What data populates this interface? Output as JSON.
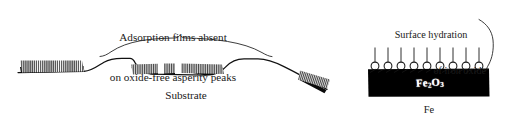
{
  "figure": {
    "domain": "scientific-diagram",
    "background_color": "#ffffff",
    "ink_color": "#1a1a1a",
    "oxide_block_color": "#000000",
    "oxide_label_color": "#ffffff",
    "width": 510,
    "height": 123
  },
  "left_panel": {
    "caption": {
      "line1": "Adsorption films absent",
      "line2": "on oxide-free asperity peaks"
    },
    "substrate_label": "Substrate"
  },
  "right_panel": {
    "caption": {
      "line1": "Surface hydration",
      "line2": "of iron oxide"
    },
    "oxide_label_formula": "Fe",
    "oxide_label_sub1": "2",
    "oxide_label_mid": "O",
    "oxide_label_sub2": "3",
    "metal_label": "Fe",
    "hydration_site_count": 9
  }
}
